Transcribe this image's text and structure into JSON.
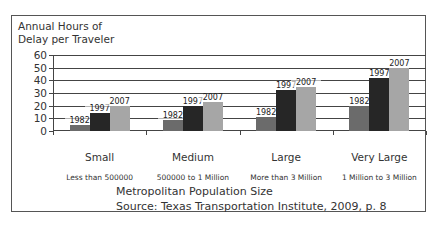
{
  "chart_data": {
    "type": "bar",
    "title": "",
    "ylabel": "Annual Hours of Delay per Traveler",
    "ylabel_lines": [
      "Annual Hours of",
      "Delay per Traveler"
    ],
    "xlabel": "Metropolitan Population Size",
    "source": "Source: Texas Transportation Institute, 2009, p. 8",
    "ylim": [
      0,
      60
    ],
    "yticks": [
      0,
      10,
      20,
      30,
      40,
      50,
      60
    ],
    "grid": true,
    "categories": [
      "Small",
      "Medium",
      "Large",
      "Very Large"
    ],
    "category_sublabels": [
      "Less than 500000",
      "500000 to 1 Million",
      "More than 3 Million",
      "1 Million to 3 Million"
    ],
    "series": [
      {
        "name": "1982",
        "color": "#6b6b6b",
        "values": [
          5,
          9,
          11,
          20
        ]
      },
      {
        "name": "1997",
        "color": "#262626",
        "values": [
          14,
          20,
          32,
          42
        ]
      },
      {
        "name": "2007",
        "color": "#a6a6a6",
        "values": [
          20,
          23,
          35,
          50
        ]
      }
    ]
  }
}
